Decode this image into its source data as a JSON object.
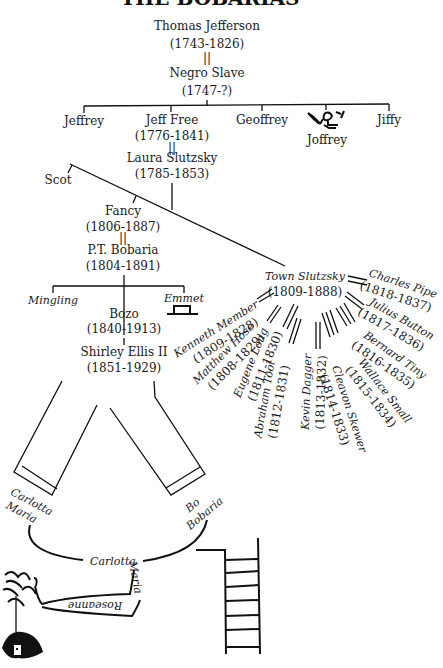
{
  "title_cropped": "THE BOBARIAS",
  "root": {
    "father": {
      "name": "Thomas Jefferson",
      "dates": "(1743-1826)"
    },
    "marriage_symbol": "||",
    "mother": {
      "name": "Negro Slave",
      "dates": "(1747-?)"
    }
  },
  "children_gen1": [
    {
      "name": "Jeffrey"
    },
    {
      "name": "Jeff Free",
      "dates": "(1776-1841)"
    },
    {
      "name": "Geoffrey"
    },
    {
      "name": "Joffrey",
      "icon": "stick-figure-icon"
    },
    {
      "name": "Jiffy"
    }
  ],
  "jeff_free_spouse": {
    "name": "Laura Slutzsky",
    "dates": "(1785-1853)"
  },
  "scot": {
    "name": "Scot"
  },
  "fancy": {
    "name": "Fancy",
    "dates": "(1806-1887)"
  },
  "fancy_spouse": {
    "name": "P.T. Bobaria",
    "dates": "(1804-1891)"
  },
  "children_gen3": [
    {
      "name": "Mingling"
    },
    {
      "name": "Bozo",
      "dates": "(1840-1913)"
    },
    {
      "name": "Emmet",
      "icon": "hat-icon"
    }
  ],
  "bozo_spouse": {
    "name": "Shirley Ellis II",
    "dates": "(1851-1929)"
  },
  "town": {
    "name": "Town Slutzsky",
    "dates": "(1809-1888)"
  },
  "town_spouses": [
    {
      "name": "Kenneth Member",
      "dates": "(1809-1828)"
    },
    {
      "name": "Matthew Hose",
      "dates": "(1808-1829)"
    },
    {
      "name": "Eugene Long",
      "dates": "(1811-1830)"
    },
    {
      "name": "Abraham Tool",
      "dates": "(1812-1831)"
    },
    {
      "name": "Kevin Dagger",
      "dates": "(1813-1832)"
    },
    {
      "name": "Cleavon Skewer",
      "dates": "(1814-1833)"
    },
    {
      "name": "Wallace Small",
      "dates": "(1815-1834)"
    },
    {
      "name": "Bernard Tiny",
      "dates": "(1816-1835)"
    },
    {
      "name": "Julius Button",
      "dates": "(1817-1836)"
    },
    {
      "name": "Charles Pipe",
      "dates": "(1818-1837)"
    }
  ],
  "legs": {
    "left_label_1": "Carlotta",
    "left_label_2": "Maria",
    "right_label_1": "Bo",
    "right_label_2": "Bobaria"
  },
  "bottom": {
    "arc_label": "Carlotta",
    "arm_label_1": "Maria",
    "arm_label_2": "Roseanne"
  }
}
